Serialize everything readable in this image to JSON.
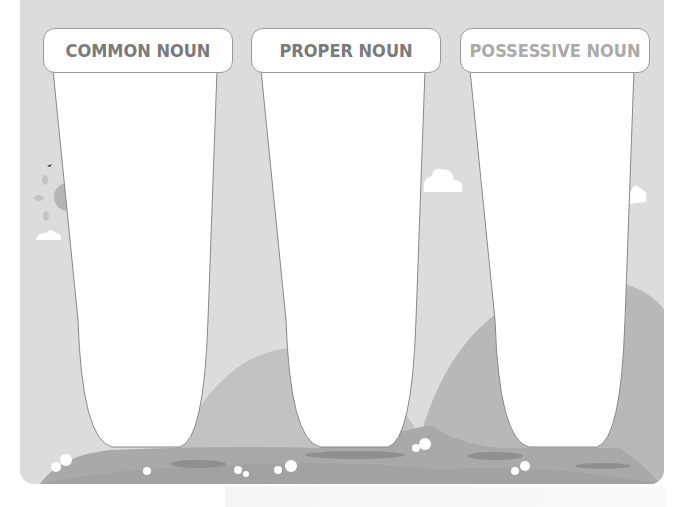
{
  "worksheet": {
    "columns": [
      {
        "label": "COMMON NOUN",
        "color": "#7a7a7a"
      },
      {
        "label": "PROPER NOUN",
        "color": "#7a7a7a"
      },
      {
        "label": "POSSESSIVE NOUN",
        "color": "#aaaaaa"
      }
    ],
    "background": {
      "sky_color": "#dcdcdc",
      "hill_color": "#b8b8b8",
      "ground_color": "#a8a8a8"
    }
  }
}
